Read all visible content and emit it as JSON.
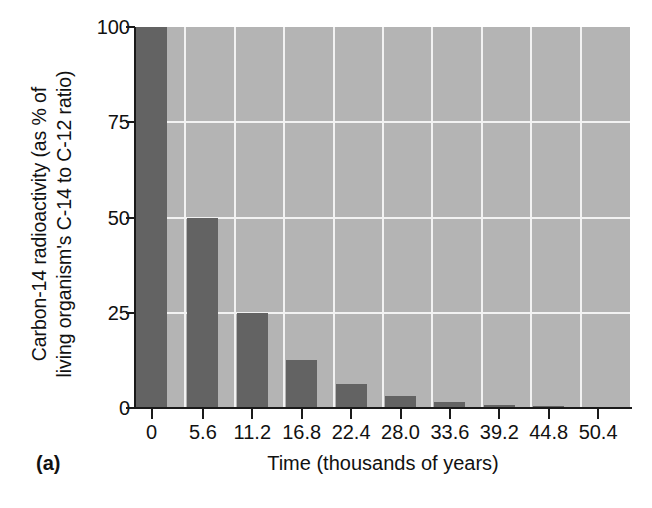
{
  "figure": {
    "panel_label": "(a)"
  },
  "chart_data": {
    "type": "bar",
    "title": "",
    "xlabel": "Time (thousands of years)",
    "ylabel_line1": "Carbon-14 radioactivity (as % of",
    "ylabel_line2": "living organism's C-14 to C-12 ratio)",
    "categories": [
      "0",
      "5.6",
      "11.2",
      "16.8",
      "22.4",
      "28.0",
      "33.6",
      "39.2",
      "44.8",
      "50.4"
    ],
    "values": [
      100,
      50,
      25,
      12.5,
      6.25,
      3.1,
      1.6,
      0.8,
      0.4,
      0.2
    ],
    "ylim": [
      0,
      100
    ],
    "yticks": [
      "100",
      "75",
      "50",
      "25",
      "0"
    ],
    "ytick_values": [
      100,
      75,
      50,
      25,
      0
    ],
    "grid": "both",
    "legend": "none",
    "colors": {
      "bar": "#636363",
      "plot_background": "#b4b4b4",
      "gridline": "#f2f2f2",
      "axis": "#1a1a1a",
      "text": "#111111",
      "page_background": "#ffffff"
    }
  }
}
